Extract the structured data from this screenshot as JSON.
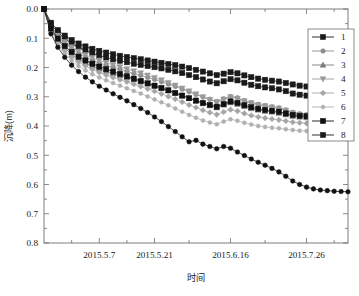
{
  "chart_data": {
    "type": "line",
    "title": "",
    "xlabel": "时间",
    "ylabel": "沉降(m)",
    "y_inverted": true,
    "ylim": [
      0.0,
      0.8
    ],
    "grid": false,
    "legend_position": "right-top",
    "y_ticks": [
      "0.0",
      "0.1",
      "0.2",
      "0.3",
      "0.4",
      "0.5",
      "0.6",
      "0.7",
      "0.8"
    ],
    "y_tick_values": [
      0.0,
      0.1,
      0.2,
      0.3,
      0.4,
      0.5,
      0.6,
      0.7,
      0.8
    ],
    "x_tick_labels": [
      "2015.5.7",
      "2015.5.21",
      "2015.6.16",
      "2015.7.26"
    ],
    "x_tick_positions": [
      8,
      16,
      27,
      38
    ],
    "x_index_range": [
      0,
      44
    ],
    "x": [
      0,
      1,
      2,
      3,
      4,
      5,
      6,
      7,
      8,
      9,
      10,
      11,
      12,
      13,
      14,
      15,
      16,
      17,
      18,
      19,
      20,
      21,
      22,
      23,
      24,
      25,
      26,
      27,
      28,
      29,
      30,
      31,
      32,
      33,
      34,
      35,
      36,
      37,
      38,
      39,
      40,
      41,
      42,
      43,
      44
    ],
    "series": [
      {
        "name": "1",
        "legend_label": "1",
        "marker": "square-filled",
        "color": "#1a1a1a",
        "values": [
          0.0,
          0.052,
          0.08,
          0.101,
          0.118,
          0.131,
          0.142,
          0.151,
          0.159,
          0.166,
          0.172,
          0.177,
          0.182,
          0.187,
          0.191,
          0.195,
          0.199,
          0.203,
          0.208,
          0.213,
          0.219,
          0.226,
          0.233,
          0.241,
          0.248,
          0.254,
          0.247,
          0.24,
          0.244,
          0.252,
          0.259,
          0.264,
          0.268,
          0.271,
          0.275,
          0.281,
          0.289,
          0.293,
          0.296,
          0.299,
          0.302,
          0.304,
          0.306,
          0.308,
          0.31
        ]
      },
      {
        "name": "2",
        "legend_label": "2",
        "marker": "circle",
        "color": "#8a8a8a",
        "values": [
          0.0,
          0.061,
          0.094,
          0.118,
          0.137,
          0.152,
          0.164,
          0.175,
          0.184,
          0.192,
          0.199,
          0.206,
          0.213,
          0.22,
          0.227,
          0.234,
          0.241,
          0.249,
          0.257,
          0.265,
          0.274,
          0.283,
          0.292,
          0.301,
          0.309,
          0.316,
          0.307,
          0.299,
          0.304,
          0.313,
          0.32,
          0.326,
          0.33,
          0.334,
          0.338,
          0.345,
          0.353,
          0.358,
          0.361,
          0.364,
          0.366,
          0.368,
          0.37,
          0.371,
          0.372
        ]
      },
      {
        "name": "3",
        "legend_label": "3",
        "marker": "triangle-up",
        "color": "#7a7a7a",
        "values": [
          0.0,
          0.07,
          0.107,
          0.134,
          0.155,
          0.171,
          0.184,
          0.195,
          0.205,
          0.213,
          0.221,
          0.228,
          0.235,
          0.242,
          0.249,
          0.256,
          0.263,
          0.271,
          0.279,
          0.287,
          0.296,
          0.305,
          0.314,
          0.323,
          0.33,
          0.337,
          0.328,
          0.32,
          0.325,
          0.333,
          0.34,
          0.345,
          0.349,
          0.352,
          0.356,
          0.361,
          0.366,
          0.369,
          0.371,
          0.373,
          0.374,
          0.375,
          0.376,
          0.377,
          0.378
        ]
      },
      {
        "name": "4",
        "legend_label": "4",
        "marker": "triangle-down",
        "color": "#9a9a9a",
        "values": [
          0.0,
          0.058,
          0.089,
          0.112,
          0.13,
          0.145,
          0.157,
          0.167,
          0.176,
          0.184,
          0.191,
          0.198,
          0.205,
          0.212,
          0.219,
          0.227,
          0.235,
          0.243,
          0.252,
          0.261,
          0.271,
          0.281,
          0.291,
          0.301,
          0.31,
          0.318,
          0.309,
          0.301,
          0.306,
          0.315,
          0.322,
          0.328,
          0.332,
          0.336,
          0.34,
          0.347,
          0.356,
          0.361,
          0.365,
          0.368,
          0.371,
          0.373,
          0.375,
          0.376,
          0.377
        ]
      },
      {
        "name": "5",
        "legend_label": "5",
        "marker": "diamond",
        "color": "#a5a5a5",
        "values": [
          0.0,
          0.075,
          0.114,
          0.142,
          0.164,
          0.181,
          0.195,
          0.207,
          0.217,
          0.226,
          0.234,
          0.242,
          0.249,
          0.257,
          0.265,
          0.273,
          0.281,
          0.29,
          0.299,
          0.308,
          0.318,
          0.328,
          0.337,
          0.346,
          0.354,
          0.361,
          0.352,
          0.344,
          0.349,
          0.357,
          0.364,
          0.369,
          0.373,
          0.376,
          0.379,
          0.383,
          0.387,
          0.389,
          0.391,
          0.392,
          0.393,
          0.394,
          0.395,
          0.396,
          0.397
        ]
      },
      {
        "name": "6",
        "legend_label": "6",
        "marker": "circle-small",
        "color": "#b0b0b0",
        "values": [
          0.0,
          0.08,
          0.122,
          0.152,
          0.176,
          0.195,
          0.21,
          0.223,
          0.234,
          0.244,
          0.253,
          0.262,
          0.271,
          0.28,
          0.289,
          0.299,
          0.309,
          0.319,
          0.329,
          0.34,
          0.351,
          0.362,
          0.372,
          0.381,
          0.388,
          0.394,
          0.385,
          0.377,
          0.382,
          0.389,
          0.395,
          0.4,
          0.403,
          0.406,
          0.408,
          0.411,
          0.414,
          0.416,
          0.417,
          0.418,
          0.419,
          0.42,
          0.421,
          0.421,
          0.422
        ]
      },
      {
        "name": "7",
        "legend_label": "7",
        "marker": "square-filled",
        "color": "#111111",
        "values": [
          0.0,
          0.066,
          0.101,
          0.127,
          0.147,
          0.163,
          0.176,
          0.187,
          0.197,
          0.206,
          0.214,
          0.222,
          0.23,
          0.238,
          0.246,
          0.254,
          0.262,
          0.27,
          0.278,
          0.287,
          0.296,
          0.305,
          0.313,
          0.321,
          0.328,
          0.334,
          0.325,
          0.316,
          0.321,
          0.329,
          0.336,
          0.341,
          0.345,
          0.348,
          0.351,
          0.357,
          0.362,
          0.365,
          0.367,
          0.369,
          0.37,
          0.371,
          0.372,
          0.373,
          0.374
        ]
      },
      {
        "name": "8",
        "legend_label": "8",
        "marker": "square-filled",
        "color": "#1a1a1a",
        "values": [
          0.0,
          0.047,
          0.072,
          0.091,
          0.106,
          0.118,
          0.128,
          0.136,
          0.143,
          0.149,
          0.155,
          0.16,
          0.164,
          0.168,
          0.172,
          0.176,
          0.18,
          0.184,
          0.188,
          0.192,
          0.197,
          0.202,
          0.208,
          0.214,
          0.22,
          0.226,
          0.221,
          0.216,
          0.22,
          0.227,
          0.233,
          0.238,
          0.242,
          0.245,
          0.248,
          0.253,
          0.258,
          0.262,
          0.265,
          0.268,
          0.271,
          0.273,
          0.275,
          0.277,
          0.278
        ]
      },
      {
        "name": "9",
        "legend_label": "",
        "marker": "circle-filled",
        "color": "#111111",
        "values": [
          0.0,
          0.085,
          0.131,
          0.165,
          0.192,
          0.214,
          0.233,
          0.249,
          0.264,
          0.277,
          0.29,
          0.302,
          0.314,
          0.327,
          0.34,
          0.354,
          0.369,
          0.385,
          0.402,
          0.419,
          0.437,
          0.454,
          0.449,
          0.462,
          0.47,
          0.478,
          0.47,
          0.476,
          0.489,
          0.501,
          0.513,
          0.524,
          0.534,
          0.545,
          0.557,
          0.572,
          0.588,
          0.6,
          0.609,
          0.615,
          0.619,
          0.621,
          0.623,
          0.624,
          0.625
        ]
      }
    ]
  },
  "legend": {
    "entries": [
      {
        "label": "1"
      },
      {
        "label": "2"
      },
      {
        "label": "3"
      },
      {
        "label": "4"
      },
      {
        "label": "5"
      },
      {
        "label": "6"
      },
      {
        "label": "7"
      },
      {
        "label": "8"
      }
    ]
  }
}
